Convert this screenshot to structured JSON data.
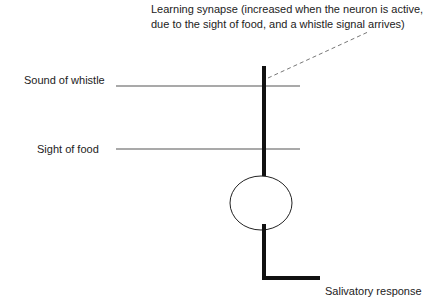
{
  "diagram": {
    "caption": {
      "line1": "Learning synapse (increased when the neuron is active,",
      "line2": "due to the sight of food, and a whistle signal arrives)"
    },
    "inputs": [
      {
        "label": "Sound of whistle"
      },
      {
        "label": "Sight of food"
      }
    ],
    "output": {
      "label": "Salivatory response"
    },
    "colors": {
      "line": "#555555",
      "neuron": "#111111",
      "dashed": "#777777"
    }
  }
}
